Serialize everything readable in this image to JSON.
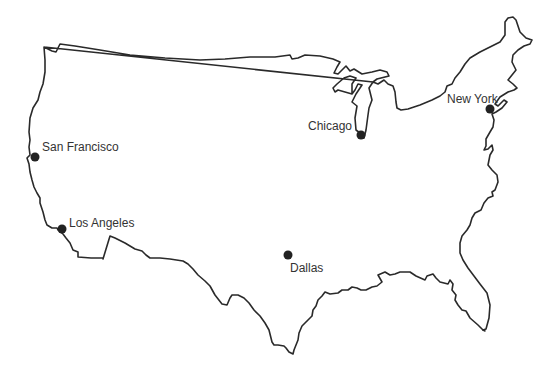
{
  "map": {
    "title": "United States",
    "stroke_color": "#2a2a2a",
    "marker_color": "#222222",
    "cities": [
      {
        "name": "San Francisco",
        "dot": {
          "x": 35,
          "y": 157
        },
        "label": {
          "x": 42,
          "y": 140
        }
      },
      {
        "name": "Los Angeles",
        "dot": {
          "x": 62,
          "y": 229
        },
        "label": {
          "x": 69,
          "y": 216
        }
      },
      {
        "name": "Chicago",
        "dot": {
          "x": 361,
          "y": 135
        },
        "label": {
          "x": 308,
          "y": 120
        }
      },
      {
        "name": "New York",
        "dot": {
          "x": 490,
          "y": 109
        },
        "label": {
          "x": 448,
          "y": 92
        }
      },
      {
        "name": "Dallas",
        "dot": {
          "x": 288,
          "y": 255
        },
        "label": {
          "x": 290,
          "y": 261
        }
      }
    ]
  }
}
